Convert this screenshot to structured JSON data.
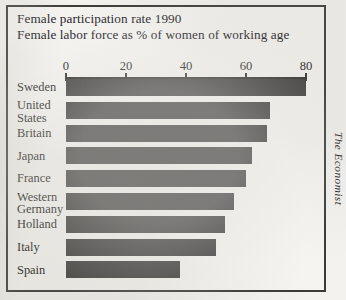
{
  "chart": {
    "title_line1": "Female participation rate 1990",
    "title_line2": "Female labor force as % of women of working age",
    "credit": "The Economist"
  },
  "chart_data": {
    "type": "bar",
    "orientation": "horizontal",
    "title": "Female participation rate 1990",
    "subtitle": "Female labor force as % of women of working age",
    "xlabel": "",
    "ylabel": "",
    "xlim": [
      0,
      80
    ],
    "xticks": [
      0,
      20,
      40,
      60,
      80
    ],
    "xtick_labels": [
      "0",
      "20",
      "40",
      "60",
      "80"
    ],
    "grid": false,
    "legend": false,
    "unit": "% of women of working age",
    "year": 1990,
    "source": "The Economist",
    "bar_color": "#3b3b3b",
    "categories": [
      "Sweden",
      "United States",
      "Britain",
      "Japan",
      "France",
      "Western Germany",
      "Holland",
      "Italy",
      "Spain"
    ],
    "values": [
      80,
      68,
      67,
      62,
      60,
      56,
      53,
      50,
      38
    ],
    "points": [
      {
        "label": "Sweden",
        "label_lines": [
          "Sweden"
        ],
        "value": 80
      },
      {
        "label": "United States",
        "label_lines": [
          "United",
          "States"
        ],
        "value": 68
      },
      {
        "label": "Britain",
        "label_lines": [
          "Britain"
        ],
        "value": 67
      },
      {
        "label": "Japan",
        "label_lines": [
          "Japan"
        ],
        "value": 62
      },
      {
        "label": "France",
        "label_lines": [
          "France"
        ],
        "value": 60
      },
      {
        "label": "Western Germany",
        "label_lines": [
          "Western",
          "Germany"
        ],
        "value": 56
      },
      {
        "label": "Holland",
        "label_lines": [
          "Holland"
        ],
        "value": 53
      },
      {
        "label": "Italy",
        "label_lines": [
          "Italy"
        ],
        "value": 50
      },
      {
        "label": "Spain",
        "label_lines": [
          "Spain"
        ],
        "value": 38
      }
    ]
  }
}
